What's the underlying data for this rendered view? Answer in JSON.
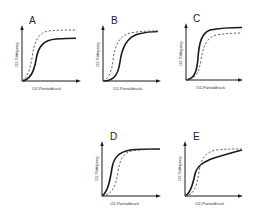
{
  "figure": {
    "panels": [
      {
        "id": "A",
        "letter": "A",
        "xlabel": "O2-Partialdruck",
        "ylabel": "O2-Sättigung"
      },
      {
        "id": "B",
        "letter": "B",
        "xlabel": "O2-Partialdruck",
        "ylabel": "O2-Sättigung"
      },
      {
        "id": "C",
        "letter": "C",
        "xlabel": "O2-Partialdruck",
        "ylabel": "O2-Sättigung"
      },
      {
        "id": "D",
        "letter": "D",
        "xlabel": "O2-Partialdruck",
        "ylabel": "O2-Sättigung"
      },
      {
        "id": "E",
        "letter": "E",
        "xlabel": "O2-Partialdruck",
        "ylabel": "O2-Sättigung"
      }
    ],
    "legend": {
      "solid": "test curve (solid)",
      "dashed": "reference curve (dashed)"
    }
  },
  "colors": {
    "line": "#1a1a1a",
    "dashed": "#555555",
    "background": "#ffffff"
  }
}
